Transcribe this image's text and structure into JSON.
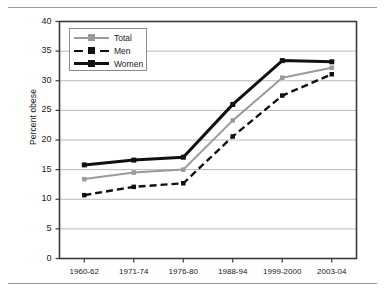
{
  "chart_data": {
    "type": "line",
    "title": "",
    "xlabel": "",
    "ylabel": "Percent obese",
    "categories": [
      "1960-62",
      "1971-74",
      "1976-80",
      "1988-94",
      "1999-2000",
      "2003-04"
    ],
    "ylim": [
      0,
      40
    ],
    "ytick_step": 5,
    "yticks": [
      0,
      5,
      10,
      15,
      20,
      25,
      30,
      35,
      40
    ],
    "grid": "horizontal",
    "legend_position": "top-left-inside",
    "series": [
      {
        "name": "Total",
        "color": "#9a9a9a",
        "style": "solid",
        "values": [
          13.4,
          14.5,
          15.0,
          23.3,
          30.5,
          32.2
        ]
      },
      {
        "name": "Men",
        "color": "#111111",
        "style": "dashed",
        "values": [
          10.7,
          12.1,
          12.7,
          20.6,
          27.5,
          31.1
        ]
      },
      {
        "name": "Women",
        "color": "#111111",
        "style": "solid-thick",
        "values": [
          15.8,
          16.6,
          17.1,
          26.0,
          33.4,
          33.2
        ]
      }
    ]
  },
  "axis": {
    "ytick_labels": [
      "40",
      "35",
      "30",
      "25",
      "20",
      "15",
      "10",
      "5",
      "0"
    ],
    "ylabel_text": "Percent obese"
  },
  "legend": {
    "items": [
      {
        "label": "Total"
      },
      {
        "label": "Men"
      },
      {
        "label": "Women"
      }
    ]
  },
  "colors": {
    "total": "#9a9a9a",
    "men": "#111111",
    "women": "#111111",
    "grid": "#b8b8b8",
    "axis": "#3a3a3a",
    "rule": "#9a9a9a"
  }
}
